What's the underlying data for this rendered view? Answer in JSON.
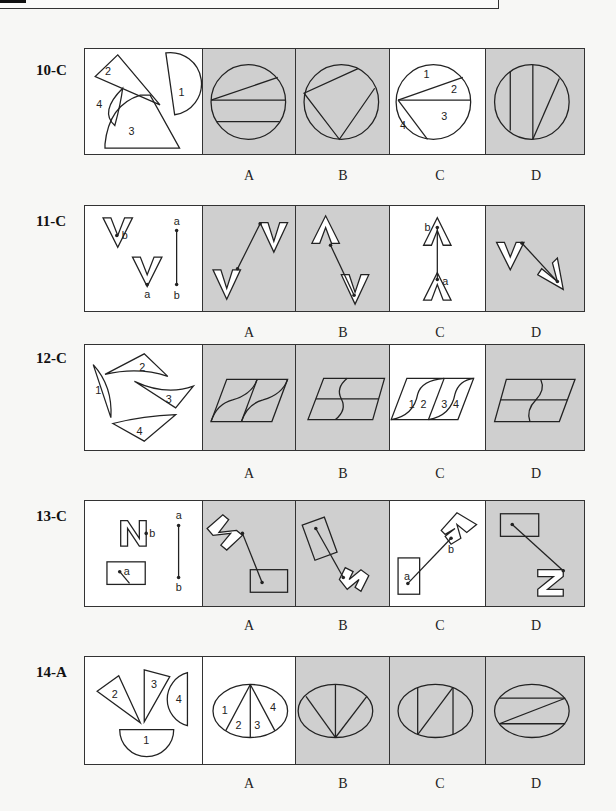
{
  "problems": [
    {
      "id": "10-C",
      "answer": "C",
      "question_pieces": [
        "1",
        "2",
        "3",
        "4"
      ],
      "options": [
        {
          "label": "A",
          "shaded": true
        },
        {
          "label": "B",
          "shaded": true
        },
        {
          "label": "C",
          "shaded": false,
          "piece_labels": [
            "1",
            "2",
            "3",
            "4"
          ]
        },
        {
          "label": "D",
          "shaded": true
        }
      ]
    },
    {
      "id": "11-C",
      "answer": "C",
      "question_points": [
        "a",
        "b"
      ],
      "connector_labels": [
        "a",
        "b"
      ],
      "options": [
        {
          "label": "A",
          "shaded": true
        },
        {
          "label": "B",
          "shaded": true
        },
        {
          "label": "C",
          "shaded": false,
          "point_labels": [
            "b",
            "a"
          ]
        },
        {
          "label": "D",
          "shaded": true
        }
      ]
    },
    {
      "id": "12-C",
      "answer": "C",
      "question_pieces": [
        "1",
        "2",
        "3",
        "4"
      ],
      "options": [
        {
          "label": "A",
          "shaded": true
        },
        {
          "label": "B",
          "shaded": true
        },
        {
          "label": "C",
          "shaded": false,
          "piece_labels": [
            "1",
            "2",
            "3",
            "4"
          ]
        },
        {
          "label": "D",
          "shaded": true
        }
      ]
    },
    {
      "id": "13-C",
      "answer": "C",
      "question_points": [
        "b",
        "a"
      ],
      "connector_labels": [
        "a",
        "b"
      ],
      "options": [
        {
          "label": "A",
          "shaded": true
        },
        {
          "label": "B",
          "shaded": true
        },
        {
          "label": "C",
          "shaded": false,
          "point_labels": [
            "a",
            "b"
          ]
        },
        {
          "label": "D",
          "shaded": true
        }
      ]
    },
    {
      "id": "14-A",
      "answer": "A",
      "question_pieces": [
        "1",
        "2",
        "3",
        "4"
      ],
      "options": [
        {
          "label": "A",
          "shaded": false,
          "piece_labels": [
            "1",
            "2",
            "3",
            "4"
          ]
        },
        {
          "label": "B",
          "shaded": true
        },
        {
          "label": "C",
          "shaded": true
        },
        {
          "label": "D",
          "shaded": true
        }
      ]
    }
  ],
  "colors": {
    "shaded_panel": "#cfcfcf",
    "answer_panel": "#ffffff",
    "stroke": "#222222"
  }
}
